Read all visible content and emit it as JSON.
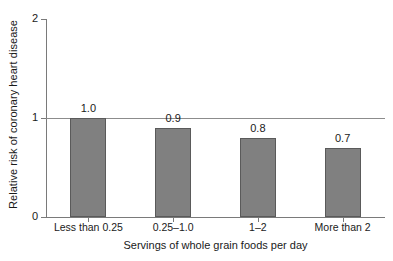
{
  "chart_data": {
    "type": "bar",
    "title": "",
    "subtitle": "",
    "xlabel": "Servings of whole grain foods per day",
    "ylabel": "Relative risk of coronary heart disease",
    "categories": [
      "Less than 0.25",
      "0.25–1.0",
      "1–2",
      "More than 2"
    ],
    "values": [
      1.0,
      0.9,
      0.8,
      0.7
    ],
    "data_labels": [
      "1.0",
      "0.9",
      "0.8",
      "0.7"
    ],
    "ylim": [
      0,
      2
    ],
    "yticks": [
      0,
      1,
      2
    ],
    "ytick_labels": [
      "0",
      "1",
      "2"
    ],
    "grid": "horizontal reference line at y=1",
    "legend": "none",
    "bar_color": "#808080",
    "bar_border_color": "#5a5a5a",
    "axis_color": "#7a7a7a",
    "gridline_color": "#8c8c8c",
    "background_color": "#ffffff",
    "text_color": "#1a1a1a"
  }
}
